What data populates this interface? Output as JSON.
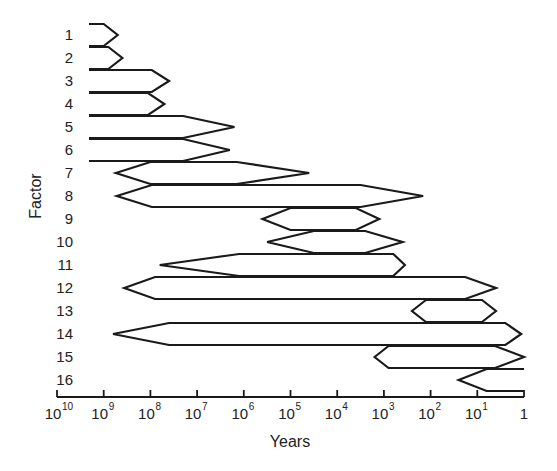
{
  "chart_data": {
    "type": "range_bar",
    "title": "",
    "xlabel": "Years",
    "ylabel": "Factor",
    "x_scale": "log",
    "x_direction": "descending",
    "x_ticks": [
      {
        "base": "10",
        "exp": "10",
        "log": 10
      },
      {
        "base": "10",
        "exp": "9",
        "log": 9
      },
      {
        "base": "10",
        "exp": "8",
        "log": 8
      },
      {
        "base": "10",
        "exp": "7",
        "log": 7
      },
      {
        "base": "10",
        "exp": "6",
        "log": 6
      },
      {
        "base": "10",
        "exp": "5",
        "log": 5
      },
      {
        "base": "10",
        "exp": "4",
        "log": 4
      },
      {
        "base": "10",
        "exp": "3",
        "log": 3
      },
      {
        "base": "10",
        "exp": "2",
        "log": 2
      },
      {
        "base": "10",
        "exp": "1",
        "log": 1
      },
      {
        "base": "1",
        "exp": "",
        "log": 0
      }
    ],
    "categories": [
      "1",
      "2",
      "3",
      "4",
      "5",
      "6",
      "7",
      "8",
      "9",
      "10",
      "11",
      "12",
      "13",
      "14",
      "15",
      "16"
    ],
    "series": [
      {
        "factor": "1",
        "start_log10_years": 9.3,
        "full_from": 9.3,
        "full_to": 9.0,
        "end_log10_years": 8.7,
        "open_left": true,
        "open_right": false
      },
      {
        "factor": "2",
        "start_log10_years": 9.3,
        "full_from": 9.3,
        "full_to": 8.9,
        "end_log10_years": 8.6,
        "open_left": true,
        "open_right": false
      },
      {
        "factor": "3",
        "start_log10_years": 9.3,
        "full_from": 9.3,
        "full_to": 7.97,
        "end_log10_years": 7.6,
        "open_left": true,
        "open_right": false
      },
      {
        "factor": "4",
        "start_log10_years": 9.3,
        "full_from": 9.3,
        "full_to": 8.05,
        "end_log10_years": 7.7,
        "open_left": true,
        "open_right": false
      },
      {
        "factor": "5",
        "start_log10_years": 9.3,
        "full_from": 9.3,
        "full_to": 7.3,
        "end_log10_years": 6.2,
        "open_left": true,
        "open_right": false
      },
      {
        "factor": "6",
        "start_log10_years": 9.3,
        "full_from": 9.3,
        "full_to": 7.3,
        "end_log10_years": 6.3,
        "open_left": true,
        "open_right": false
      },
      {
        "factor": "7",
        "start_log10_years": 8.74,
        "full_from": 8.0,
        "full_to": 6.15,
        "end_log10_years": 4.6,
        "open_left": false,
        "open_right": false
      },
      {
        "factor": "8",
        "start_log10_years": 8.72,
        "full_from": 7.97,
        "full_to": 3.5,
        "end_log10_years": 2.16,
        "open_left": false,
        "open_right": false
      },
      {
        "factor": "9",
        "start_log10_years": 5.6,
        "full_from": 5.0,
        "full_to": 3.6,
        "end_log10_years": 3.1,
        "open_left": false,
        "open_right": false
      },
      {
        "factor": "10",
        "start_log10_years": 5.5,
        "full_from": 4.5,
        "full_to": 3.4,
        "end_log10_years": 2.6,
        "open_left": false,
        "open_right": false
      },
      {
        "factor": "11",
        "start_log10_years": 7.8,
        "full_from": 6.1,
        "full_to": 2.8,
        "end_log10_years": 2.55,
        "open_left": false,
        "open_right": false
      },
      {
        "factor": "12",
        "start_log10_years": 8.56,
        "full_from": 7.9,
        "full_to": 1.26,
        "end_log10_years": 0.6,
        "open_left": false,
        "open_right": false
      },
      {
        "factor": "13",
        "start_log10_years": 2.4,
        "full_from": 2.1,
        "full_to": 0.9,
        "end_log10_years": 0.6,
        "open_left": false,
        "open_right": false
      },
      {
        "factor": "14",
        "start_log10_years": 8.8,
        "full_from": 7.6,
        "full_to": 0.4,
        "end_log10_years": 0.06,
        "open_left": false,
        "open_right": false
      },
      {
        "factor": "15",
        "start_log10_years": 3.2,
        "full_from": 2.9,
        "full_to": 0.62,
        "end_log10_years": 0.0,
        "open_left": false,
        "open_right": false
      },
      {
        "factor": "16",
        "start_log10_years": 1.4,
        "full_from": 0.8,
        "full_to": 0.0,
        "end_log10_years": 0.0,
        "open_left": false,
        "open_right": true
      }
    ],
    "grid": false,
    "legend": null,
    "xlim_log10": [
      10,
      0
    ]
  },
  "layout": {
    "axis_y": 397,
    "x_at_log10": 524,
    "px_per_decade": 46.7,
    "row0_y": 35,
    "row_step": 23,
    "bar_half_height": 11,
    "open_left_x": 89
  },
  "colors": {
    "stroke": "#1a1a1a",
    "text": "#222222",
    "background": "#ffffff"
  }
}
